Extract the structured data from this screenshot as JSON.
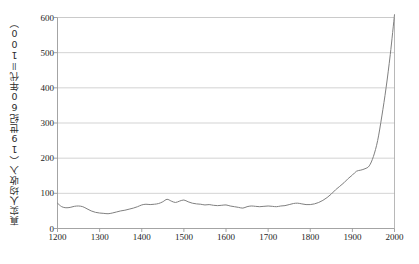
{
  "chart_data": {
    "type": "line",
    "title": "",
    "xlabel": "",
    "ylabel": "真实人均收入（19世纪60年代＝100）",
    "xlim": [
      1200,
      2000
    ],
    "ylim": [
      0,
      600
    ],
    "grid": true,
    "legend": "none",
    "xticks": [
      1200,
      1300,
      1400,
      1500,
      1600,
      1700,
      1800,
      1900,
      2000
    ],
    "xtick_labels": [
      "1200",
      "1300",
      "1400",
      "1500",
      "1600",
      "1700",
      "1800",
      "1900",
      "2000"
    ],
    "yticks": [
      0,
      100,
      200,
      300,
      400,
      500,
      600
    ],
    "ytick_labels": [
      "0",
      "100",
      "200",
      "300",
      "400",
      "500",
      "600"
    ],
    "line_color": "#808080",
    "grid_color": "#c8c8c8",
    "axis_color": "#9a9a9a",
    "background_color": "#ffffff",
    "series": [
      {
        "name": "真实人均收入",
        "x": [
          1200,
          1210,
          1220,
          1230,
          1240,
          1250,
          1260,
          1270,
          1280,
          1290,
          1300,
          1310,
          1320,
          1330,
          1340,
          1350,
          1360,
          1370,
          1380,
          1390,
          1400,
          1410,
          1420,
          1430,
          1440,
          1450,
          1460,
          1470,
          1480,
          1490,
          1500,
          1510,
          1520,
          1530,
          1540,
          1550,
          1560,
          1570,
          1580,
          1590,
          1600,
          1610,
          1620,
          1630,
          1640,
          1650,
          1660,
          1670,
          1680,
          1690,
          1700,
          1710,
          1720,
          1730,
          1740,
          1750,
          1760,
          1770,
          1780,
          1790,
          1800,
          1810,
          1820,
          1830,
          1840,
          1850,
          1860,
          1870,
          1880,
          1890,
          1900,
          1910,
          1920,
          1930,
          1940,
          1950,
          1960,
          1970,
          1980,
          1990,
          2000
        ],
        "y": [
          72,
          62,
          59,
          60,
          63,
          64,
          62,
          56,
          50,
          46,
          44,
          43,
          42,
          44,
          47,
          50,
          52,
          55,
          58,
          62,
          67,
          69,
          68,
          69,
          71,
          76,
          83,
          78,
          74,
          78,
          81,
          76,
          72,
          70,
          69,
          67,
          68,
          66,
          65,
          66,
          67,
          64,
          62,
          60,
          58,
          62,
          64,
          63,
          62,
          63,
          64,
          63,
          62,
          64,
          65,
          68,
          71,
          72,
          70,
          68,
          68,
          70,
          74,
          80,
          88,
          98,
          110,
          120,
          130,
          142,
          152,
          163,
          166,
          170,
          178,
          205,
          250,
          320,
          400,
          495,
          608
        ]
      }
    ],
    "annotations": []
  }
}
